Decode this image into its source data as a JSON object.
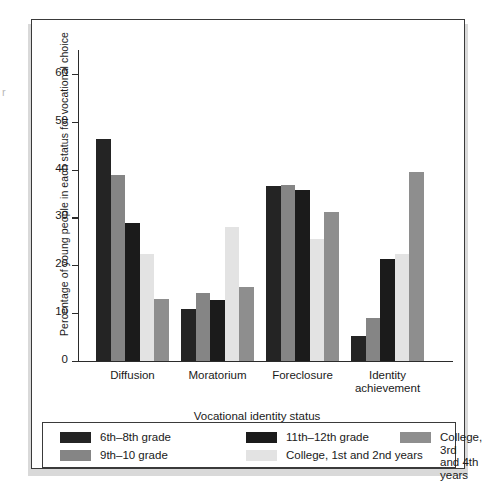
{
  "chart_data": {
    "type": "bar",
    "title": "",
    "xlabel": "Vocational identity status",
    "ylabel": "Percentage of young people in each status for vocational choice",
    "categories": [
      "Diffusion",
      "Moratorium",
      "Foreclosure",
      "Identity\nachievement"
    ],
    "ylim": [
      0,
      65
    ],
    "yticks": [
      0,
      10,
      20,
      30,
      40,
      50,
      60
    ],
    "ytick_labels": [
      "0",
      "10",
      "20",
      "30",
      "40",
      "50",
      "60"
    ],
    "grid": false,
    "legend_position": "bottom",
    "series": [
      {
        "name": "6th–8th grade",
        "color": "#242424",
        "values": [
          46.5,
          10.8,
          36.6,
          5.2
        ]
      },
      {
        "name": "9th–10 grade",
        "color": "#858585",
        "values": [
          38.8,
          14.3,
          36.8,
          8.9
        ]
      },
      {
        "name": "11th–12th grade",
        "color": "#1b1b1b",
        "values": [
          28.9,
          12.7,
          35.8,
          21.3
        ]
      },
      {
        "name": "College, 1st and 2nd years",
        "color": "#e3e3e3",
        "values": [
          22.3,
          28.0,
          25.4,
          22.3
        ]
      },
      {
        "name": "College, 3rd and 4th years",
        "color": "#8e8e8e",
        "values": [
          12.9,
          15.4,
          31.1,
          39.5
        ]
      }
    ]
  },
  "legend": {
    "entries": [
      {
        "label": "6th–8th grade",
        "color": "#242424"
      },
      {
        "label": "9th–10 grade",
        "color": "#858585"
      },
      {
        "label": "11th–12th grade",
        "color": "#1b1b1b"
      },
      {
        "label": "College, 1st and 2nd years",
        "color": "#e3e3e3"
      },
      {
        "label": "College, 3rd\nand 4th years",
        "color": "#8e8e8e"
      }
    ]
  },
  "artifact": {
    "glyph": "r"
  }
}
